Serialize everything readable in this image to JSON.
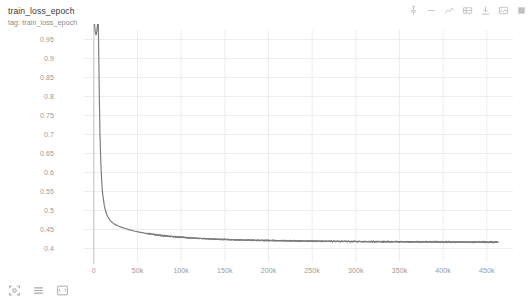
{
  "header": {
    "title": "train_loss_epoch",
    "subtitle": "tag: train_loss_epoch"
  },
  "toolbar": {
    "icons": [
      {
        "name": "pin-icon",
        "label": "Pin card"
      },
      {
        "name": "dash-icon",
        "label": "Toggle"
      },
      {
        "name": "chart-type-icon",
        "label": "Chart type"
      },
      {
        "name": "data-table-icon",
        "label": "Data table"
      },
      {
        "name": "download-icon",
        "label": "Download data"
      },
      {
        "name": "image-icon",
        "label": "Save image"
      },
      {
        "name": "fullscreen-icon",
        "label": "Fullscreen"
      }
    ]
  },
  "controls": [
    {
      "name": "fit-domain-icon",
      "label": "Fit domain to data"
    },
    {
      "name": "settings-lines-icon",
      "label": "Chart options"
    },
    {
      "name": "expand-icon",
      "label": "Expand"
    }
  ],
  "colors": {
    "line": "#7a7a7a",
    "grid": "#ededed",
    "axis": "#bdbdbd",
    "tick_text": "#9a9a9a",
    "background": "#ffffff"
  },
  "chart_data": {
    "type": "line",
    "title": "train_loss_epoch",
    "subtitle": "tag: train_loss_epoch",
    "xlabel": "",
    "ylabel": "",
    "grid": true,
    "legend": null,
    "xlim": [
      -9000,
      480000
    ],
    "ylim": [
      0.375,
      0.975
    ],
    "xticks": [
      0,
      50000,
      100000,
      150000,
      200000,
      250000,
      300000,
      350000,
      400000,
      450000
    ],
    "xticklabels": [
      "0",
      "50k",
      "100k",
      "150k",
      "200k",
      "250k",
      "300k",
      "350k",
      "400k",
      "450k"
    ],
    "yticks": [
      0.4,
      0.45,
      0.5,
      0.55,
      0.6,
      0.65,
      0.7,
      0.75,
      0.8,
      0.85,
      0.9,
      0.95
    ],
    "yticklabels": [
      "0.4",
      "0.45",
      "0.5",
      "0.55",
      "0.6",
      "0.65",
      "0.7",
      "0.75",
      "0.8",
      "0.85",
      "0.9",
      "0.95"
    ],
    "series": [
      {
        "name": "train_loss_epoch",
        "color": "#7a7a7a",
        "x": [
          0,
          600,
          1200,
          1800,
          2400,
          3000,
          3600,
          4200,
          5000,
          6000,
          7000,
          8000,
          9000,
          10000,
          12000,
          14000,
          16000,
          18000,
          20000,
          24000,
          28000,
          32000,
          36000,
          40000,
          46000,
          52000,
          58000,
          64000,
          70000,
          78000,
          86000,
          94000,
          102000,
          112000,
          122000,
          132000,
          142000,
          155000,
          168000,
          180000,
          195000,
          210000,
          225000,
          240000,
          255000,
          270000,
          285000,
          300000,
          315000,
          330000,
          345000,
          360000,
          375000,
          390000,
          405000,
          420000,
          435000,
          450000,
          462000
        ],
        "y": [
          1.02,
          0.995,
          0.978,
          0.968,
          0.962,
          0.966,
          0.976,
          0.99,
          1.01,
          0.84,
          0.7,
          0.625,
          0.575,
          0.545,
          0.512,
          0.494,
          0.483,
          0.4755,
          0.4705,
          0.4635,
          0.459,
          0.4555,
          0.4525,
          0.4498,
          0.4462,
          0.4432,
          0.4405,
          0.4382,
          0.4362,
          0.434,
          0.4322,
          0.4305,
          0.4292,
          0.4277,
          0.4264,
          0.4253,
          0.4244,
          0.4234,
          0.4225,
          0.4219,
          0.4212,
          0.4206,
          0.4201,
          0.4197,
          0.4193,
          0.419,
          0.4187,
          0.4184,
          0.4182,
          0.418,
          0.4178,
          0.4176,
          0.4175,
          0.4173,
          0.4172,
          0.4171,
          0.417,
          0.4169,
          0.4169
        ]
      }
    ],
    "annotations": [
      {
        "text": "initial spike clipped above axis top",
        "x": 2500,
        "y": 1.0
      }
    ]
  }
}
